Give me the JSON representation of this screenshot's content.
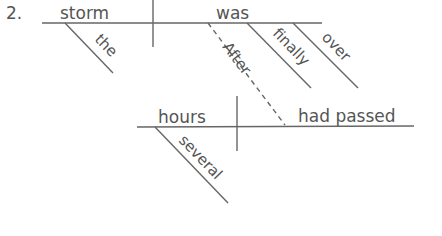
{
  "problem_number": "2.",
  "sentence_diagram": {
    "main_clause": {
      "subject": "storm",
      "verb": "was",
      "modifiers": {
        "subject_modifier": "the",
        "verb_modifiers": [
          "finally",
          "over"
        ],
        "connector": "After"
      }
    },
    "subordinate_clause": {
      "subject": "hours",
      "verb": "had passed",
      "subject_modifier": "several"
    }
  },
  "colors": {
    "line": "#666666",
    "text": "#555555"
  }
}
